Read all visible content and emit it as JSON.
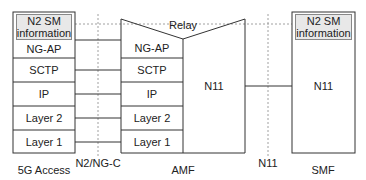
{
  "diagram": {
    "relay_label": "Relay",
    "interfaces": {
      "n2": "N2/NG-C",
      "n11": "N11"
    },
    "nodes": {
      "access": {
        "name": "5G Access",
        "info_line1": "N2 SM",
        "info_line2": "information",
        "layers": [
          "NG-AP",
          "SCTP",
          "IP",
          "Layer 2",
          "Layer 1"
        ]
      },
      "amf": {
        "name": "AMF",
        "layers": [
          "NG-AP",
          "SCTP",
          "IP",
          "Layer 2",
          "Layer 1"
        ],
        "right_protocol": "N11"
      },
      "smf": {
        "name": "SMF",
        "info_line1": "N2 SM",
        "info_line2": "information",
        "protocol": "N11"
      }
    },
    "colors": {
      "line": "#333333",
      "dotted": "#888888",
      "info_fill": "#e8e8e8"
    }
  }
}
